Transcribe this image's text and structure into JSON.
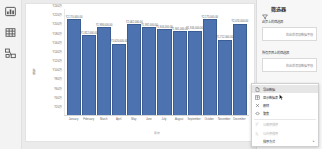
{
  "rail": {
    "items": [
      {
        "name": "report-view-icon",
        "label": "报表视图"
      },
      {
        "name": "data-view-icon",
        "label": "数据视图"
      },
      {
        "name": "model-view-icon",
        "label": "模型视图"
      }
    ]
  },
  "filters_pane": {
    "title": "筛选器",
    "funnel_icon": "funnel-icon",
    "groups": [
      {
        "label": "此页上的筛选器",
        "drop_placeholder": "在此处添加数据字段"
      },
      {
        "label": "所有页面上的筛选器",
        "drop_placeholder": "在此处添加数据字段"
      }
    ]
  },
  "context_menu": {
    "items": [
      {
        "label": "导出数据",
        "icon": "export-data-icon",
        "highlighted": true,
        "disabled": false,
        "submenu": false
      },
      {
        "label": "显示数据表",
        "icon": "show-as-table-icon",
        "highlighted": false,
        "disabled": false,
        "submenu": false
      },
      {
        "label": "删除",
        "icon": "remove-icon",
        "highlighted": false,
        "disabled": false,
        "submenu": false
      },
      {
        "label": "聚焦",
        "icon": "spotlight-icon",
        "highlighted": false,
        "disabled": false,
        "submenu": false
      },
      {
        "label": "以降序排序",
        "icon": "sort-descending-icon",
        "highlighted": false,
        "disabled": true,
        "submenu": false
      },
      {
        "label": "以升序排序",
        "icon": "sort-ascending-icon",
        "highlighted": false,
        "disabled": true,
        "submenu": false
      },
      {
        "label": "排序方式",
        "icon": "",
        "highlighted": false,
        "disabled": false,
        "submenu": true,
        "chevron": "▸"
      }
    ]
  },
  "chart_data": {
    "type": "bar",
    "title": "",
    "xlabel": "月份",
    "ylabel": "销售额",
    "categories": [
      "January",
      "February",
      "March",
      "April",
      "May",
      "June",
      "July",
      "August",
      "September",
      "October",
      "November",
      "December"
    ],
    "values": [
      2170000,
      1812000,
      1986000,
      1620000,
      2062000,
      1992000,
      1944000,
      1905000,
      1916000,
      2175000,
      1712000,
      2074000
    ],
    "data_labels": [
      "¥2,170,000.00",
      "¥1,812,000.00",
      "¥1,986,000.00",
      "¥1,620,000.00",
      "¥2,062,000.00",
      "¥1,992,000.00",
      "¥1,944,000.00",
      "¥1,905,000.00",
      "¥1,916,000.00",
      "¥2,175,000.00",
      "¥1,712,000.00",
      "¥2,074,000.00"
    ],
    "ylim": [
      0,
      2400000
    ],
    "ytick_labels": [
      "¥240万",
      "¥220万",
      "¥200万",
      "¥180万",
      "¥160万",
      "¥140万",
      "¥120万",
      "¥100万",
      "¥80万",
      "¥60万",
      "¥40万",
      "¥20万"
    ],
    "ytick_values": [
      2400000,
      2200000,
      2000000,
      1800000,
      1600000,
      1400000,
      1200000,
      1000000,
      800000,
      600000,
      400000,
      200000
    ],
    "grid": false,
    "legend": "none",
    "bar_color": "#4c72b0"
  }
}
